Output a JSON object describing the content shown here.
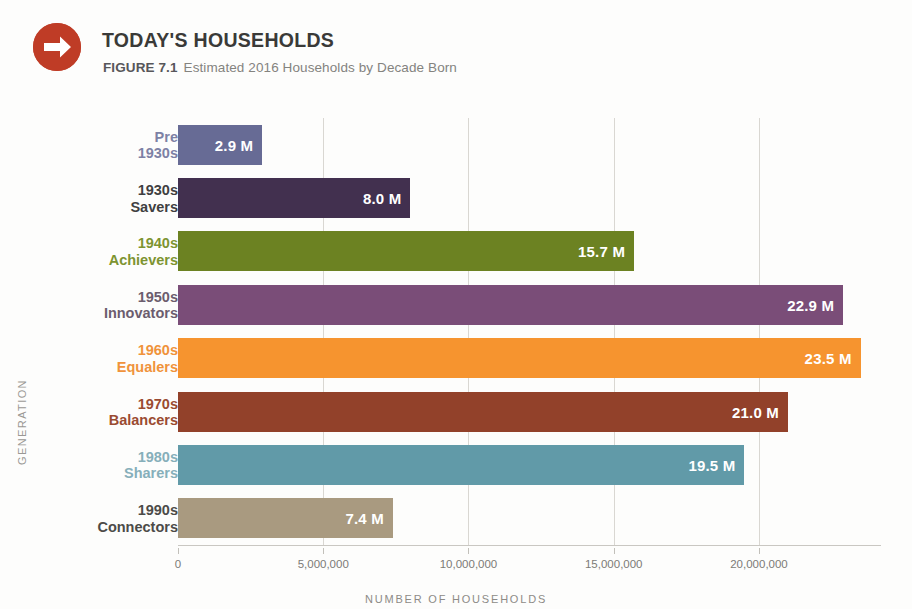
{
  "header": {
    "icon": "arrow-right-circle-icon",
    "icon_color": "#bf3c26",
    "title": "TODAY'S HOUSEHOLDS",
    "figure_label": "FIGURE 7.1",
    "figure_caption": "Estimated 2016 Households by Decade Born"
  },
  "chart_data": {
    "type": "bar",
    "orientation": "horizontal",
    "title": "TODAY'S HOUSEHOLDS",
    "subtitle": "Estimated 2016 Households by Decade Born",
    "xlabel": "NUMBER OF HOUSEHOLDS",
    "ylabel": "GENERATION",
    "grid": true,
    "legend": false,
    "xlim": [
      0,
      24200000
    ],
    "xticks": [
      0,
      5000000,
      10000000,
      15000000,
      20000000
    ],
    "xtick_labels": [
      "0",
      "5,000,000",
      "10,000,000",
      "15,000,000",
      "20,000,000"
    ],
    "categories": [
      "Pre 1930s",
      "1930s Savers",
      "1940s Achievers",
      "1950s Innovators",
      "1960s Equalers",
      "1970s Balancers",
      "1980s Sharers",
      "1990s Connectors"
    ],
    "values": [
      2900000,
      8000000,
      15700000,
      22900000,
      23500000,
      21000000,
      19500000,
      7400000
    ],
    "value_labels": [
      "2.9 M",
      "8.0 M",
      "15.7 M",
      "22.9 M",
      "23.5 M",
      "21.0 M",
      "19.5 M",
      "7.4 M"
    ],
    "bars": [
      {
        "line1": "Pre",
        "line2": "1930s",
        "value": 2900000,
        "label": "2.9 M",
        "color": "#676b95",
        "label_color": "#7d81a5"
      },
      {
        "line1": "1930s",
        "line2": "Savers",
        "value": 8000000,
        "label": "8.0 M",
        "color": "#42304f",
        "label_color": "#3f3f41"
      },
      {
        "line1": "1940s",
        "line2": "Achievers",
        "value": 15700000,
        "label": "15.7 M",
        "color": "#6c8222",
        "label_color": "#7d9431"
      },
      {
        "line1": "1950s",
        "line2": "Innovators",
        "value": 22900000,
        "label": "22.9 M",
        "color": "#7a4d78",
        "label_color": "#6c5d6e"
      },
      {
        "line1": "1960s",
        "line2": "Equalers",
        "value": 23500000,
        "label": "23.5 M",
        "color": "#f6942f",
        "label_color": "#f0933b"
      },
      {
        "line1": "1970s",
        "line2": "Balancers",
        "value": 21000000,
        "label": "21.0 M",
        "color": "#92412a",
        "label_color": "#9a4b31"
      },
      {
        "line1": "1980s",
        "line2": "Sharers",
        "value": 19500000,
        "label": "19.5 M",
        "color": "#619aa8",
        "label_color": "#86afba"
      },
      {
        "line1": "1990s",
        "line2": "Connectors",
        "value": 7400000,
        "label": "7.4 M",
        "color": "#a99a80",
        "label_color": "#4c4b48"
      }
    ]
  }
}
